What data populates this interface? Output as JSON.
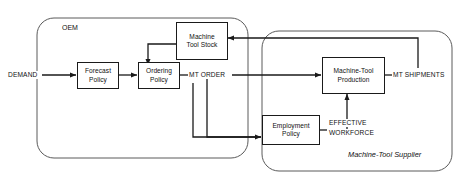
{
  "diagram": {
    "line_color": "#1a1a1a",
    "background": "#ffffff",
    "boundaries": [
      {
        "id": "oem",
        "label": "OEM"
      },
      {
        "id": "supplier",
        "label": "Machine-Tool Supplier"
      }
    ],
    "nodes": [
      {
        "id": "forecast-policy",
        "line1": "Forecast",
        "line2": "Policy"
      },
      {
        "id": "ordering-policy",
        "line1": "Ordering",
        "line2": "Policy"
      },
      {
        "id": "machine-tool-stock",
        "line1": "Machine",
        "line2": "Tool Stock"
      },
      {
        "id": "machine-tool-production",
        "line1": "Machine-Tool",
        "line2": "Production"
      },
      {
        "id": "employment-policy",
        "line1": "Employment",
        "line2": "Policy"
      }
    ],
    "flows": [
      {
        "id": "demand",
        "label": "DEMAND"
      },
      {
        "id": "mt-order",
        "label": "MT ORDER"
      },
      {
        "id": "mt-shipments",
        "label": "MT SHIPMENTS"
      },
      {
        "id": "effective-workforce-l1",
        "label": "EFFECTIVE"
      },
      {
        "id": "effective-workforce-l2",
        "label": "WORKFORCE"
      }
    ]
  }
}
